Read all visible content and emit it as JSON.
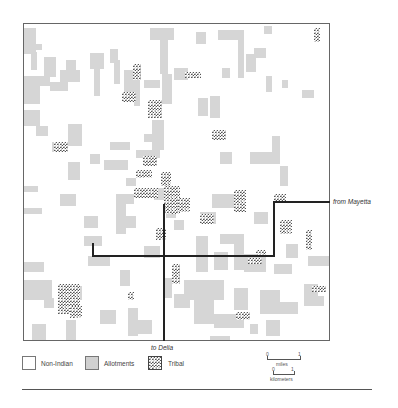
{
  "map": {
    "frame": {
      "x": 23,
      "y": 23,
      "w": 307,
      "h": 318
    },
    "colors": {
      "allotment": "#d6d6d6",
      "tribal": "#555555",
      "non_indian": "#ffffff",
      "road": "#222222"
    },
    "allotments": [
      [
        0,
        4,
        12,
        26
      ],
      [
        7,
        28,
        6,
        18
      ],
      [
        12,
        20,
        6,
        6
      ],
      [
        20,
        33,
        12,
        20
      ],
      [
        26,
        58,
        18,
        9
      ],
      [
        0,
        52,
        16,
        28
      ],
      [
        14,
        52,
        12,
        10
      ],
      [
        36,
        46,
        20,
        12
      ],
      [
        42,
        36,
        10,
        16
      ],
      [
        66,
        29,
        14,
        16
      ],
      [
        86,
        25,
        8,
        14
      ],
      [
        70,
        44,
        6,
        28
      ],
      [
        90,
        36,
        6,
        24
      ],
      [
        100,
        46,
        12,
        28
      ],
      [
        110,
        46,
        6,
        36
      ],
      [
        126,
        4,
        24,
        12
      ],
      [
        136,
        12,
        8,
        38
      ],
      [
        150,
        44,
        14,
        12
      ],
      [
        138,
        50,
        10,
        30
      ],
      [
        120,
        56,
        16,
        8
      ],
      [
        172,
        8,
        10,
        12
      ],
      [
        194,
        6,
        26,
        10
      ],
      [
        214,
        10,
        6,
        44
      ],
      [
        174,
        74,
        10,
        18
      ],
      [
        186,
        72,
        10,
        22
      ],
      [
        198,
        44,
        8,
        10
      ],
      [
        240,
        2,
        8,
        8
      ],
      [
        230,
        24,
        12,
        10
      ],
      [
        222,
        30,
        10,
        18
      ],
      [
        242,
        52,
        6,
        16
      ],
      [
        258,
        56,
        6,
        8
      ],
      [
        278,
        66,
        12,
        8
      ],
      [
        0,
        86,
        16,
        16
      ],
      [
        12,
        102,
        12,
        10
      ],
      [
        28,
        118,
        16,
        10
      ],
      [
        44,
        100,
        14,
        22
      ],
      [
        66,
        130,
        10,
        10
      ],
      [
        86,
        118,
        20,
        8
      ],
      [
        80,
        136,
        24,
        10
      ],
      [
        120,
        110,
        18,
        8
      ],
      [
        112,
        126,
        24,
        8
      ],
      [
        128,
        96,
        12,
        30
      ],
      [
        102,
        154,
        10,
        8
      ],
      [
        100,
        170,
        10,
        10
      ],
      [
        0,
        162,
        14,
        6
      ],
      [
        0,
        184,
        18,
        6
      ],
      [
        44,
        138,
        12,
        18
      ],
      [
        36,
        170,
        16,
        12
      ],
      [
        60,
        192,
        14,
        12
      ],
      [
        60,
        212,
        18,
        10
      ],
      [
        92,
        170,
        10,
        40
      ],
      [
        96,
        192,
        16,
        12
      ],
      [
        130,
        164,
        20,
        12
      ],
      [
        142,
        170,
        10,
        24
      ],
      [
        150,
        196,
        10,
        10
      ],
      [
        176,
        188,
        16,
        12
      ],
      [
        188,
        170,
        24,
        14
      ],
      [
        226,
        128,
        30,
        12
      ],
      [
        248,
        112,
        8,
        20
      ],
      [
        196,
        128,
        12,
        12
      ],
      [
        256,
        142,
        8,
        20
      ],
      [
        172,
        212,
        12,
        36
      ],
      [
        196,
        210,
        24,
        10
      ],
      [
        190,
        228,
        14,
        18
      ],
      [
        230,
        188,
        14,
        12
      ],
      [
        210,
        220,
        10,
        26
      ],
      [
        220,
        230,
        22,
        18
      ],
      [
        262,
        220,
        12,
        14
      ],
      [
        284,
        232,
        22,
        10
      ],
      [
        0,
        238,
        20,
        10
      ],
      [
        0,
        256,
        28,
        20
      ],
      [
        20,
        274,
        10,
        10
      ],
      [
        46,
        262,
        12,
        14
      ],
      [
        42,
        296,
        10,
        20
      ],
      [
        76,
        286,
        16,
        14
      ],
      [
        104,
        284,
        10,
        28
      ],
      [
        114,
        296,
        14,
        14
      ],
      [
        140,
        254,
        8,
        20
      ],
      [
        150,
        270,
        16,
        14
      ],
      [
        160,
        256,
        40,
        20
      ],
      [
        170,
        260,
        20,
        40
      ],
      [
        210,
        264,
        14,
        22
      ],
      [
        236,
        266,
        20,
        24
      ],
      [
        256,
        278,
        18,
        12
      ],
      [
        280,
        272,
        20,
        10
      ],
      [
        226,
        300,
        8,
        10
      ],
      [
        242,
        296,
        14,
        16
      ],
      [
        186,
        312,
        20,
        6
      ],
      [
        96,
        246,
        10,
        16
      ],
      [
        190,
        290,
        30,
        14
      ],
      [
        250,
        240,
        18,
        10
      ],
      [
        280,
        260,
        14,
        14
      ],
      [
        120,
        222,
        16,
        12
      ],
      [
        64,
        232,
        22,
        10
      ],
      [
        8,
        300,
        14,
        18
      ]
    ],
    "tribals": [
      [
        109,
        40,
        8,
        16
      ],
      [
        161,
        48,
        16,
        6
      ],
      [
        98,
        68,
        14,
        10
      ],
      [
        124,
        76,
        14,
        18
      ],
      [
        30,
        118,
        14,
        10
      ],
      [
        188,
        106,
        14,
        10
      ],
      [
        290,
        4,
        6,
        14
      ],
      [
        119,
        132,
        14,
        10
      ],
      [
        112,
        146,
        16,
        8
      ],
      [
        137,
        148,
        10,
        14
      ],
      [
        110,
        164,
        24,
        10
      ],
      [
        140,
        162,
        16,
        28
      ],
      [
        154,
        174,
        12,
        14
      ],
      [
        176,
        190,
        14,
        10
      ],
      [
        210,
        166,
        12,
        22
      ],
      [
        250,
        170,
        12,
        8
      ],
      [
        282,
        206,
        6,
        20
      ],
      [
        224,
        234,
        14,
        6
      ],
      [
        148,
        240,
        8,
        20
      ],
      [
        288,
        262,
        14,
        6
      ],
      [
        34,
        260,
        22,
        30
      ],
      [
        104,
        268,
        6,
        8
      ],
      [
        46,
        282,
        12,
        12
      ],
      [
        232,
        226,
        10,
        6
      ],
      [
        212,
        288,
        14,
        8
      ],
      [
        256,
        196,
        12,
        14
      ],
      [
        132,
        204,
        10,
        12
      ]
    ],
    "roads": [
      {
        "x": 163,
        "y": 204,
        "w": 2,
        "h": 137
      },
      {
        "x": 92,
        "y": 255,
        "w": 183,
        "h": 2
      },
      {
        "x": 273,
        "y": 201,
        "w": 2,
        "h": 56
      },
      {
        "x": 273,
        "y": 201,
        "w": 57,
        "h": 2
      },
      {
        "x": 92,
        "y": 243,
        "w": 2,
        "h": 14
      }
    ],
    "labels": {
      "from_mayetta": "from Mayetta",
      "to_delia": "to Delia"
    }
  },
  "legend": {
    "items": [
      {
        "label": "Non-Indian",
        "type": "non-indian"
      },
      {
        "label": "Allotments",
        "type": "allotment"
      },
      {
        "label": "Tribal",
        "type": "tribal"
      }
    ],
    "scale": {
      "miles": {
        "start": "0",
        "end": "1",
        "unit": "miles"
      },
      "kilometers": {
        "start": "0",
        "end": "1",
        "unit": "kilometers"
      }
    }
  }
}
